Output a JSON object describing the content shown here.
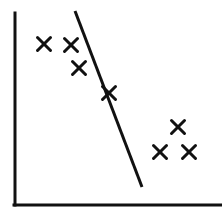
{
  "figure": {
    "width": 222,
    "height": 212,
    "background_color": "#ffffff",
    "ink_color": "#111111"
  },
  "chart_data": {
    "type": "scatter",
    "title": "",
    "subtitle": "",
    "xlabel": "",
    "ylabel": "",
    "grid": false,
    "legend": null,
    "axes": {
      "style": "open-left-bottom-spines",
      "x_axis_ticks": [],
      "y_axis_ticks": [],
      "xlim": [
        0,
        100
      ],
      "ylim": [
        0,
        100
      ],
      "x_axis_line": {
        "x1": 15,
        "y1": 205,
        "x2": 221,
        "y2": 205
      },
      "y_axis_line": {
        "x1": 15,
        "y1": 13,
        "x2": 15,
        "y2": 205
      },
      "axis_line_width": 3
    },
    "series": [
      {
        "name": "observations",
        "marker": "x",
        "marker_color": "#111111",
        "marker_size": 13,
        "marker_line_width": 3,
        "points": [
          {
            "id": "point-1",
            "px": 44,
            "py": 44,
            "x": 14,
            "y": 84
          },
          {
            "id": "point-2",
            "px": 71,
            "py": 45,
            "x": 27,
            "y": 83
          },
          {
            "id": "point-3",
            "px": 79,
            "py": 68,
            "x": 31,
            "y": 71
          },
          {
            "id": "point-4",
            "px": 109,
            "py": 93,
            "x": 46,
            "y": 58
          },
          {
            "id": "point-5",
            "px": 178,
            "py": 127,
            "x": 79,
            "y": 41
          },
          {
            "id": "point-6",
            "px": 160,
            "py": 152,
            "x": 70,
            "y": 28
          },
          {
            "id": "point-7",
            "px": 189,
            "py": 152,
            "x": 84,
            "y": 28
          }
        ]
      }
    ],
    "annotations": [
      {
        "id": "trend-line",
        "type": "line",
        "label": "fitted trend line",
        "color": "#111111",
        "line_width": 3,
        "px1": 75,
        "py1": 11,
        "px2": 142,
        "py2": 187,
        "x1": 31,
        "y1": 100,
        "x2": 62,
        "y2": 9
      }
    ]
  }
}
